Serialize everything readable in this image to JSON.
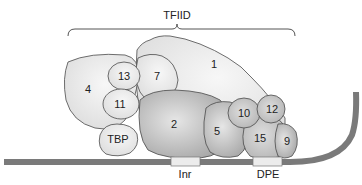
{
  "diagram": {
    "title": "TFIID",
    "subunits": [
      {
        "id": "1",
        "label": "1"
      },
      {
        "id": "2",
        "label": "2"
      },
      {
        "id": "4",
        "label": "4"
      },
      {
        "id": "5",
        "label": "5"
      },
      {
        "id": "7",
        "label": "7"
      },
      {
        "id": "9",
        "label": "9"
      },
      {
        "id": "10",
        "label": "10"
      },
      {
        "id": "11",
        "label": "11"
      },
      {
        "id": "12",
        "label": "12"
      },
      {
        "id": "13",
        "label": "13"
      },
      {
        "id": "15",
        "label": "15"
      },
      {
        "id": "TBP",
        "label": "TBP"
      }
    ],
    "promoter_elements": [
      {
        "label": "Inr"
      },
      {
        "label": "DPE"
      }
    ],
    "colors": {
      "dna": "#7a7a7a",
      "outline": "#4a4a4a",
      "light_fill": "#e8e8e8",
      "mid_fill": "#c9c9c9",
      "dark_fill": "#a9a9a9",
      "element_box": "#ececec"
    }
  }
}
